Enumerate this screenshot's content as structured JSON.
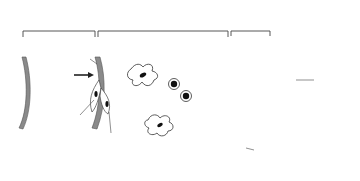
{
  "diagram": {
    "regions": [
      {
        "id": "capillary",
        "label": "Capillary"
      },
      {
        "id": "peri-capillary",
        "label": "Peri-capillary space"
      },
      {
        "id": "epithelial-barrier",
        "label_line1": "Epithelial",
        "label_line2": "cell barrier"
      }
    ],
    "labels": {
      "basement_membrane_line1": "Capillary",
      "basement_membrane_line2": "basement",
      "basement_membrane_line3": "membrane",
      "antigen": "Antigen",
      "endothelial_line1": "Endothelial",
      "endothelial_line2": "cell",
      "pericyte": "Pericyte",
      "lymphocyte": "Lymphocyte",
      "macrophage": "Macrophage",
      "thymocytes_line1": "Thymocytes",
      "thymocytes_line2": "of cortex",
      "interconnecting_line1": "Interconnecting",
      "interconnecting_line2": "epithelial cells"
    },
    "colors": {
      "line": "#333333",
      "wall_fill": "#8a8a8a",
      "nucleus": "#111111",
      "background": "#ffffff"
    }
  }
}
